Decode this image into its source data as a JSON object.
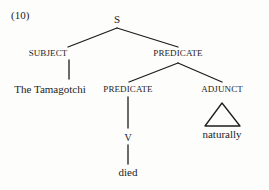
{
  "figure": {
    "example_number": "(10)",
    "type": "syntax-tree",
    "ink_color": "#1c1c1c",
    "background_color": "#fdfdfc"
  },
  "tree": {
    "root": {
      "label": "S",
      "x": 117,
      "y": 20
    },
    "nodes": [
      {
        "id": "subject",
        "label": "SUBJECT",
        "kind": "category",
        "x": 48,
        "y": 54
      },
      {
        "id": "predicate-upper",
        "label": "PREDICATE",
        "kind": "category",
        "x": 178,
        "y": 54
      },
      {
        "id": "the-tamagotchi",
        "label": "The Tamagotchi",
        "kind": "terminal",
        "x": 50,
        "y": 90
      },
      {
        "id": "predicate-lower",
        "label": "PREDICATE",
        "kind": "category",
        "x": 128,
        "y": 90
      },
      {
        "id": "adjunct",
        "label": "ADJUNCT",
        "kind": "category",
        "x": 222,
        "y": 90
      },
      {
        "id": "v",
        "label": "V",
        "kind": "category",
        "x": 128,
        "y": 138
      },
      {
        "id": "died",
        "label": "died",
        "kind": "terminal",
        "x": 128,
        "y": 173
      },
      {
        "id": "naturally",
        "label": "naturally",
        "kind": "terminal",
        "x": 222,
        "y": 135
      }
    ],
    "triangle": {
      "under": "adjunct",
      "apex_x": 222,
      "apex_y": 103,
      "left_x": 205,
      "left_y": 126,
      "right_x": 240,
      "right_y": 126
    },
    "edges": [
      {
        "from": "root",
        "to": "subject",
        "x1": 117,
        "y1": 28,
        "x2": 68,
        "y2": 47
      },
      {
        "from": "root",
        "to": "predicate-upper",
        "x1": 117,
        "y1": 28,
        "x2": 178,
        "y2": 47
      },
      {
        "from": "subject",
        "to": "the-tamagotchi",
        "x1": 69,
        "y1": 60,
        "x2": 69,
        "y2": 79
      },
      {
        "from": "predicate-upper",
        "to": "predicate-lower",
        "x1": 178,
        "y1": 63,
        "x2": 129,
        "y2": 82
      },
      {
        "from": "predicate-upper",
        "to": "adjunct",
        "x1": 178,
        "y1": 63,
        "x2": 222,
        "y2": 82
      },
      {
        "from": "predicate-lower",
        "to": "v",
        "x1": 128,
        "y1": 97,
        "x2": 128,
        "y2": 128
      },
      {
        "from": "v",
        "to": "died",
        "x1": 128,
        "y1": 145,
        "x2": 128,
        "y2": 164
      }
    ]
  }
}
